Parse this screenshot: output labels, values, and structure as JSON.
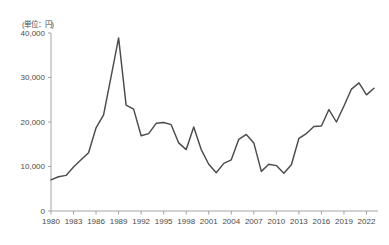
{
  "chart_data": {
    "type": "line",
    "title": "",
    "subtitle": "",
    "unit_label": "(単位：円)",
    "xlabel": "",
    "ylabel": "",
    "ylim": [
      0,
      40000
    ],
    "xlim": [
      1980,
      2023
    ],
    "grid": false,
    "legend": false,
    "y_ticks": [
      0,
      10000,
      20000,
      30000,
      40000
    ],
    "y_tick_labels": [
      "0",
      "10,000",
      "20,000",
      "30,000",
      "40,000"
    ],
    "x_ticks": [
      1980,
      1983,
      1986,
      1989,
      1992,
      1995,
      1998,
      2001,
      2004,
      2007,
      2010,
      2013,
      2016,
      2019,
      2022
    ],
    "x_tick_labels": [
      "1980",
      "1983",
      "1986",
      "1989",
      "1992",
      "1995",
      "1998",
      "2001",
      "2004",
      "2007",
      "2010",
      "2013",
      "2016",
      "2019",
      "2022"
    ],
    "line_color": "#4b4b4b",
    "axis_color": "#9a9a9a",
    "series": [
      {
        "name": "株価",
        "x": [
          1980,
          1981,
          1982,
          1983,
          1984,
          1985,
          1986,
          1987,
          1988,
          1989,
          1990,
          1991,
          1992,
          1993,
          1994,
          1995,
          1996,
          1997,
          1998,
          1999,
          2000,
          2001,
          2002,
          2003,
          2004,
          2005,
          2006,
          2007,
          2008,
          2009,
          2010,
          2011,
          2012,
          2013,
          2014,
          2015,
          2016,
          2017,
          2018,
          2019,
          2020,
          2021,
          2022,
          2023
        ],
        "values": [
          7000,
          7700,
          8000,
          9900,
          11500,
          13100,
          18700,
          21600,
          30200,
          38900,
          23800,
          22900,
          16900,
          17400,
          19700,
          19900,
          19400,
          15300,
          13800,
          18900,
          13800,
          10500,
          8600,
          10700,
          11500,
          16100,
          17200,
          15300,
          8900,
          10500,
          10200,
          8500,
          10400,
          16300,
          17400,
          19000,
          19100,
          22800,
          20000,
          23600,
          27400,
          28800,
          26100,
          27600
        ]
      }
    ]
  }
}
